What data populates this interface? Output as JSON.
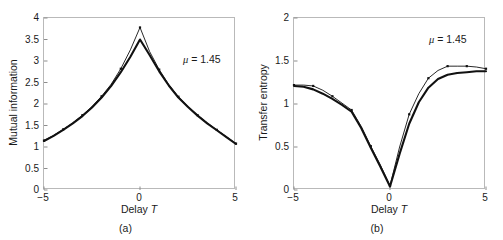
{
  "figure": {
    "panels": [
      {
        "id": "a",
        "caption": "(a)",
        "ylabel": "Mutual information",
        "xlabel_text": "Delay ",
        "xlabel_italic": "T",
        "annotation_symbol": "μ",
        "annotation_value": "= 1.45"
      },
      {
        "id": "b",
        "caption": "(b)",
        "ylabel": "Transfer entropy",
        "xlabel_text": "Delay ",
        "xlabel_italic": "T",
        "annotation_symbol": "μ",
        "annotation_value": "= 1.45"
      }
    ]
  },
  "chart_data": [
    {
      "type": "line",
      "panel": "a",
      "title": "",
      "xlabel": "Delay T",
      "ylabel": "Mutual information",
      "xlim": [
        -5,
        5
      ],
      "ylim": [
        0,
        4
      ],
      "xticks": [
        -5,
        0,
        5
      ],
      "xtick_labels": [
        "-5",
        "0",
        "5"
      ],
      "yticks": [
        0,
        0.5,
        1,
        1.5,
        2,
        2.5,
        3,
        3.5,
        4
      ],
      "ytick_labels": [
        "0",
        "0.5",
        "1",
        "1.5",
        "2",
        "2.5",
        "3",
        "3.5",
        "4"
      ],
      "grid": false,
      "legend": false,
      "annotations": [
        {
          "text": "μ = 1.45",
          "x": 2.4,
          "y": 3.05
        }
      ],
      "x": [
        -5,
        -4.5,
        -4,
        -3.5,
        -3,
        -2.5,
        -2,
        -1.5,
        -1,
        -0.5,
        0,
        0.5,
        1,
        1.5,
        2,
        2.5,
        3,
        3.5,
        4,
        4.5,
        5
      ],
      "series": [
        {
          "name": "upper-thin",
          "style": "thin-with-markers",
          "values": [
            1.15,
            1.27,
            1.41,
            1.56,
            1.74,
            1.94,
            2.18,
            2.46,
            2.82,
            3.26,
            3.78,
            3.22,
            2.8,
            2.45,
            2.17,
            1.94,
            1.74,
            1.56,
            1.4,
            1.24,
            1.08
          ]
        },
        {
          "name": "lower-thick",
          "style": "thick",
          "values": [
            1.14,
            1.26,
            1.4,
            1.55,
            1.72,
            1.92,
            2.15,
            2.42,
            2.74,
            3.1,
            3.5,
            3.14,
            2.76,
            2.43,
            2.15,
            1.93,
            1.73,
            1.55,
            1.39,
            1.23,
            1.07
          ]
        }
      ]
    },
    {
      "type": "line",
      "panel": "b",
      "title": "",
      "xlabel": "Delay T",
      "ylabel": "Transfer entropy",
      "xlim": [
        -5,
        5
      ],
      "ylim": [
        0,
        2
      ],
      "xticks": [
        -5,
        0,
        5
      ],
      "xtick_labels": [
        "-5",
        "0",
        "5"
      ],
      "yticks": [
        0,
        0.5,
        1,
        1.5,
        2
      ],
      "ytick_labels": [
        "0",
        "0.5",
        "1",
        "1.5",
        "2"
      ],
      "grid": false,
      "legend": false,
      "annotations": [
        {
          "text": "μ = 1.45",
          "x": 2.5,
          "y": 1.72
        }
      ],
      "x": [
        -5,
        -4.5,
        -4,
        -3.5,
        -3,
        -2.5,
        -2,
        -1.5,
        -1,
        -0.5,
        0,
        0.5,
        1,
        1.5,
        2,
        2.5,
        3,
        3.5,
        4,
        4.5,
        5
      ],
      "series": [
        {
          "name": "upper-thin",
          "style": "thin-with-markers",
          "values": [
            1.22,
            1.22,
            1.21,
            1.16,
            1.09,
            1.01,
            0.93,
            0.74,
            0.51,
            0.29,
            0.05,
            0.5,
            0.88,
            1.12,
            1.3,
            1.39,
            1.44,
            1.44,
            1.44,
            1.43,
            1.41
          ]
        },
        {
          "name": "lower-thick",
          "style": "thick",
          "values": [
            1.21,
            1.2,
            1.17,
            1.12,
            1.06,
            0.99,
            0.91,
            0.72,
            0.49,
            0.27,
            0.04,
            0.42,
            0.77,
            1.02,
            1.19,
            1.29,
            1.34,
            1.36,
            1.37,
            1.38,
            1.38
          ]
        }
      ]
    }
  ]
}
